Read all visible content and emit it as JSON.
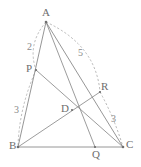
{
  "figure": {
    "type": "geometry-diagram",
    "canvas": {
      "width": 141,
      "height": 167,
      "background": "#ffffff"
    },
    "styles": {
      "line_color": "#8a8a8a",
      "arc_color": "#a8a8a8",
      "label_color": "#6e6e6e",
      "measure_color": "#8a8a8a"
    },
    "points": [
      {
        "id": "A",
        "label": "A",
        "x": 46,
        "y": 22,
        "label_dx": -4,
        "label_dy": -15,
        "on": "apex"
      },
      {
        "id": "B",
        "label": "B",
        "x": 18,
        "y": 147,
        "label_dx": -9,
        "label_dy": -1,
        "on": "base-left"
      },
      {
        "id": "C",
        "label": "C",
        "x": 123,
        "y": 147,
        "label_dx": 3,
        "label_dy": -2,
        "on": "base-right"
      },
      {
        "id": "P",
        "label": "P",
        "x": 36,
        "y": 70,
        "label_dx": -10,
        "label_dy": -6,
        "on": "segment-AB"
      },
      {
        "id": "Q",
        "label": "Q",
        "x": 95,
        "y": 147,
        "label_dx": -3,
        "label_dy": 3,
        "on": "segment-BC"
      },
      {
        "id": "R",
        "label": "R",
        "x": 100,
        "y": 92,
        "label_dx": 1,
        "label_dy": -11,
        "on": "segment-AC"
      },
      {
        "id": "D",
        "label": "D",
        "x": 72,
        "y": 110,
        "label_dx": -11,
        "label_dy": -6,
        "on": "interior-intersection"
      }
    ],
    "edges": [
      {
        "id": "AB",
        "from": "A",
        "to": "B",
        "kind": "side"
      },
      {
        "id": "AC",
        "from": "A",
        "to": "C",
        "kind": "side"
      },
      {
        "id": "BC",
        "from": "B",
        "to": "C",
        "kind": "side"
      }
    ],
    "cevians": [
      {
        "id": "AQ",
        "from": "A",
        "to": "Q",
        "kind": "cevian"
      },
      {
        "id": "BR",
        "from": "B",
        "to": "R",
        "kind": "cevian"
      },
      {
        "id": "CP",
        "from": "C",
        "to": "P",
        "kind": "cevian"
      }
    ],
    "arcs": [
      {
        "id": "arc-AP",
        "from": "A",
        "to": "P",
        "style": "dashed",
        "bulge": "outward-left"
      },
      {
        "id": "arc-PB",
        "from": "P",
        "to": "B",
        "style": "dashed",
        "bulge": "outward-left"
      },
      {
        "id": "arc-AR",
        "from": "A",
        "to": "R",
        "style": "dashed",
        "bulge": "outward-right"
      },
      {
        "id": "arc-RC",
        "from": "R",
        "to": "C",
        "style": "dashed",
        "bulge": "outward-right"
      }
    ],
    "measures": [
      {
        "id": "measure-AP",
        "value": "2",
        "segment": "AP",
        "x": 27,
        "y": 42
      },
      {
        "id": "measure-PB",
        "value": "3",
        "segment": "PB",
        "x": 14,
        "y": 105
      },
      {
        "id": "measure-AR",
        "value": "5",
        "segment": "AR",
        "x": 78,
        "y": 48
      },
      {
        "id": "measure-RC",
        "value": "3",
        "segment": "RC",
        "x": 111,
        "y": 114
      }
    ]
  }
}
